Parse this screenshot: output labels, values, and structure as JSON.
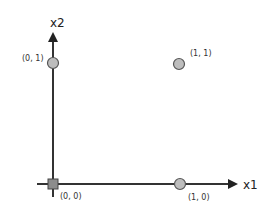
{
  "diagram": {
    "axes": {
      "x": {
        "label": "x1"
      },
      "y": {
        "label": "x2"
      }
    },
    "points": [
      {
        "label": "(0, 0)",
        "x": 0,
        "y": 0,
        "marker": "square"
      },
      {
        "label": "(0, 1)",
        "x": 0,
        "y": 1,
        "marker": "circle"
      },
      {
        "label": "(1, 0)",
        "x": 1,
        "y": 0,
        "marker": "circle"
      },
      {
        "label": "(1, 1)",
        "x": 1,
        "y": 1,
        "marker": "circle"
      }
    ],
    "colors": {
      "axis": "#333333",
      "marker_fill": "#bdbdbd",
      "marker_stroke": "#555555",
      "square_fill": "#8c8c8c"
    }
  }
}
